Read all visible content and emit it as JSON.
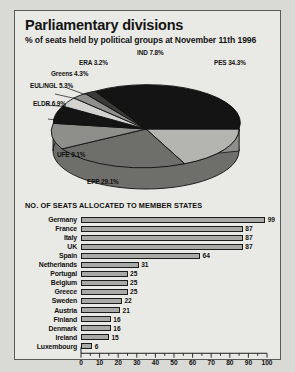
{
  "header": {
    "title": "Parliamentary divisions",
    "subtitle": "% of seats held by political groups at November 11th 1996"
  },
  "bar_section": {
    "heading": "NO. OF SEATS ALLOCATED TO MEMBER STATES"
  },
  "colors": {
    "page_background": "#d9d9d6",
    "panel_background": "#e9e9e5",
    "panel_border": "#5a5a57",
    "bar_fill": "#a9a9a6",
    "bar_outline": "#1c1c1c",
    "pie_dark": "#141414",
    "pie_light": "#b4b4b1",
    "pie_mid": "#6e6e6b",
    "pie_pale": "#d2d2cf"
  },
  "chart_data": [
    {
      "type": "pie",
      "title": "Parliamentary divisions",
      "subtitle": "% of seats held by political groups at November 11th 1996",
      "unit": "%",
      "labels": [
        "PES",
        "EPP",
        "UFE",
        "ELDR",
        "EUL/NGL",
        "Greens",
        "ERA",
        "IND"
      ],
      "values": [
        34.3,
        29.1,
        9.1,
        6.9,
        5.3,
        4.3,
        3.2,
        7.8
      ],
      "slices": [
        {
          "label": "PES",
          "value": 34.3,
          "text": "PES 34.3%",
          "color": "#b4b4b1"
        },
        {
          "label": "EPP",
          "value": 29.1,
          "text": "EPP 29.1%",
          "color": "#6e6e6b"
        },
        {
          "label": "UFE",
          "value": 9.1,
          "text": "UFE 9.1%",
          "color": "#8e8e8b"
        },
        {
          "label": "ELDR",
          "value": 6.9,
          "text": "ELDR 6.9%",
          "color": "#141414"
        },
        {
          "label": "EUL/NGL",
          "value": 5.3,
          "text": "EUL/NGL 5.3%",
          "color": "#d2d2cf"
        },
        {
          "label": "Greens",
          "value": 4.3,
          "text": "Greens 4.3%",
          "color": "#8e8e8b"
        },
        {
          "label": "ERA",
          "value": 3.2,
          "text": "ERA 3.2%",
          "color": "#3a3a38"
        },
        {
          "label": "IND",
          "value": 7.8,
          "text": "IND 7.8%",
          "color": "#141414"
        }
      ],
      "legend": "labels-on-chart",
      "grid": false
    },
    {
      "type": "bar",
      "orientation": "horizontal",
      "title": "NO. OF SEATS ALLOCATED TO MEMBER STATES",
      "xlabel": "",
      "ylabel": "",
      "xlim": [
        0,
        100
      ],
      "xticks": [
        0,
        10,
        20,
        30,
        40,
        50,
        60,
        70,
        80,
        90,
        100
      ],
      "minor_tick_step": 5,
      "grid": false,
      "categories": [
        "Germany",
        "France",
        "Italy",
        "UK",
        "Spain",
        "Netherlands",
        "Portugal",
        "Belgium",
        "Greece",
        "Sweden",
        "Austria",
        "Finland",
        "Denmark",
        "Ireland",
        "Luxembourg"
      ],
      "values": [
        99,
        87,
        87,
        87,
        64,
        31,
        25,
        25,
        25,
        22,
        21,
        16,
        16,
        15,
        6
      ],
      "value_labels": [
        "99",
        "87",
        "87",
        "87",
        "64",
        "31",
        "25",
        "25",
        "25",
        "22",
        "21",
        "16",
        "16",
        "15",
        "6"
      ]
    }
  ]
}
